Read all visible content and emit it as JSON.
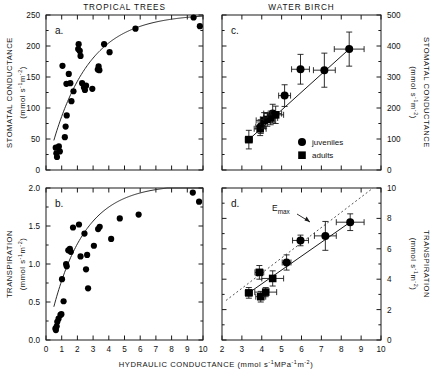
{
  "figure": {
    "width": 433,
    "height": 379,
    "panel_titles": {
      "left": "TROPICAL TREES",
      "right": "WATER BIRCH"
    },
    "xlabel": "HYDRAULIC CONDUCTANCE (mmol s⁻¹MPa⁻¹m⁻²)",
    "annotation_emax": "E",
    "annotation_emax_sub": "max",
    "legend": [
      {
        "marker": "circle",
        "label": "juveniles"
      },
      {
        "marker": "square",
        "label": "adults"
      }
    ]
  },
  "chart_data": [
    {
      "type": "scatter",
      "panel": "a.",
      "title": "TROPICAL TREES",
      "xlabel": "HYDRAULIC CONDUCTANCE (mmol s-1MPa-1m-2)",
      "ylabel": "STOMATAL CONDUCTANCE (mmol s-1m-2)",
      "xlim": [
        0,
        10
      ],
      "ylim": [
        0,
        250
      ],
      "xticks": [
        0,
        1,
        2,
        3,
        4,
        5,
        6,
        7,
        8,
        9,
        10
      ],
      "yticks": [
        0,
        50,
        100,
        150,
        200,
        250
      ],
      "grid": false,
      "points": [
        [
          0.62,
          36
        ],
        [
          0.66,
          27
        ],
        [
          0.7,
          21
        ],
        [
          0.82,
          38
        ],
        [
          0.88,
          30
        ],
        [
          1.05,
          168
        ],
        [
          1.3,
          139
        ],
        [
          1.32,
          88
        ],
        [
          1.25,
          70
        ],
        [
          1.2,
          53
        ],
        [
          1.45,
          155
        ],
        [
          1.55,
          140
        ],
        [
          1.62,
          111
        ],
        [
          1.75,
          127
        ],
        [
          2.05,
          195
        ],
        [
          2.08,
          203
        ],
        [
          2.2,
          184
        ],
        [
          2.15,
          192
        ],
        [
          2.3,
          140
        ],
        [
          2.42,
          133
        ],
        [
          2.48,
          129
        ],
        [
          2.55,
          136
        ],
        [
          2.95,
          131
        ],
        [
          3.3,
          162
        ],
        [
          3.35,
          167
        ],
        [
          3.4,
          161
        ],
        [
          3.7,
          203
        ],
        [
          4.05,
          190
        ],
        [
          5.7,
          228
        ],
        [
          9.4,
          246
        ],
        [
          9.8,
          232
        ]
      ],
      "fit_curve": {
        "form": "saturating",
        "ymax": 252,
        "k": 0.42
      },
      "legend_position": "none"
    },
    {
      "type": "scatter",
      "panel": "b.",
      "title": "TROPICAL TREES",
      "xlabel": "HYDRAULIC CONDUCTANCE (mmol s-1MPa-1m-2)",
      "ylabel": "TRANSPIRATION (mmol s-1m-2)",
      "xlim": [
        0,
        10
      ],
      "ylim": [
        0.0,
        2.0
      ],
      "xticks": [
        0,
        1,
        2,
        3,
        4,
        5,
        6,
        7,
        8,
        9,
        10
      ],
      "yticks": [
        0.0,
        0.5,
        1.0,
        1.5,
        2.0
      ],
      "grid": false,
      "points": [
        [
          0.6,
          0.15
        ],
        [
          0.63,
          0.13
        ],
        [
          0.68,
          0.18
        ],
        [
          0.72,
          0.24
        ],
        [
          0.8,
          0.28
        ],
        [
          0.92,
          0.33
        ],
        [
          0.98,
          0.34
        ],
        [
          1.02,
          0.8
        ],
        [
          1.12,
          0.51
        ],
        [
          1.28,
          1.0
        ],
        [
          1.32,
          0.97
        ],
        [
          1.42,
          1.18
        ],
        [
          1.52,
          1.2
        ],
        [
          1.58,
          1.16
        ],
        [
          1.72,
          1.48
        ],
        [
          2.1,
          1.52
        ],
        [
          2.2,
          1.1
        ],
        [
          2.45,
          1.4
        ],
        [
          2.55,
          0.93
        ],
        [
          2.62,
          1.12
        ],
        [
          2.68,
          0.68
        ],
        [
          3.05,
          1.24
        ],
        [
          3.32,
          1.46
        ],
        [
          3.42,
          1.49
        ],
        [
          4.15,
          1.33
        ],
        [
          4.7,
          1.6
        ],
        [
          5.9,
          1.65
        ],
        [
          9.35,
          1.94
        ],
        [
          9.75,
          1.82
        ]
      ],
      "fit_curve": {
        "form": "saturating",
        "ymax": 2.05,
        "k": 0.48
      },
      "legend_position": "none"
    },
    {
      "type": "scatter",
      "panel": "c.",
      "title": "WATER BIRCH",
      "xlabel": "HYDRAULIC CONDUCTANCE (mmol s-1MPa-1m-2)",
      "ylabel": "STOMATAL CONDUCTANCE (mmol s-1m-2)",
      "xlim": [
        2,
        10
      ],
      "ylim": [
        0,
        500
      ],
      "xticks": [
        2,
        3,
        4,
        5,
        6,
        7,
        8,
        9,
        10
      ],
      "yticks": [
        0,
        100,
        200,
        300,
        400,
        500
      ],
      "grid": false,
      "series": [
        {
          "name": "juveniles",
          "marker": "circle",
          "points": [
            {
              "x": 3.95,
              "y": 140,
              "xerr": 0.25,
              "yerr": 22
            },
            {
              "x": 4.55,
              "y": 182,
              "xerr": 0.45,
              "yerr": 30
            },
            {
              "x": 5.15,
              "y": 240,
              "xerr": 0.3,
              "yerr": 35
            },
            {
              "x": 5.95,
              "y": 325,
              "xerr": 0.45,
              "yerr": 48
            },
            {
              "x": 7.15,
              "y": 322,
              "xerr": 0.55,
              "yerr": 55
            },
            {
              "x": 8.4,
              "y": 390,
              "xerr": 0.75,
              "yerr": 55
            }
          ]
        },
        {
          "name": "adults",
          "marker": "square",
          "points": [
            {
              "x": 3.35,
              "y": 98,
              "xerr": 0.18,
              "yerr": 30
            },
            {
              "x": 3.92,
              "y": 133,
              "xerr": 0.3,
              "yerr": 22
            },
            {
              "x": 4.12,
              "y": 160,
              "xerr": 0.4,
              "yerr": 25
            },
            {
              "x": 4.28,
              "y": 163,
              "xerr": 0.35,
              "yerr": 22
            },
            {
              "x": 4.45,
              "y": 168,
              "xerr": 0.35,
              "yerr": 22
            },
            {
              "x": 4.7,
              "y": 178,
              "xerr": 0.4,
              "yerr": 28
            }
          ]
        }
      ],
      "fit_line": {
        "form": "linear",
        "x1": 3.35,
        "y1": 98,
        "x2": 8.4,
        "y2": 390
      },
      "legend_position": "lower-right"
    },
    {
      "type": "scatter",
      "panel": "d.",
      "title": "WATER BIRCH",
      "xlabel": "HYDRAULIC CONDUCTANCE (mmol s-1MPa-1m-2)",
      "ylabel": "TRANSPIRATION (mmol s-1m-2)",
      "xlim": [
        2,
        10
      ],
      "ylim": [
        0,
        10
      ],
      "xticks": [
        2,
        3,
        4,
        5,
        6,
        7,
        8,
        9,
        10
      ],
      "yticks": [
        0,
        2,
        4,
        6,
        8,
        10
      ],
      "grid": false,
      "annotations": [
        {
          "text": "Emax",
          "x": 4.4,
          "y": 8.7,
          "style": "dotted-line-label"
        }
      ],
      "reference_line": {
        "name": "Emax",
        "style": "dotted",
        "x1": 2.2,
        "y1": 2.6,
        "x2": 9.6,
        "y2": 10.6
      },
      "series": [
        {
          "name": "juveniles",
          "marker": "circle",
          "points": [
            {
              "x": 5.25,
              "y": 5.1,
              "xerr": 0.22,
              "yerr": 0.5
            },
            {
              "x": 5.95,
              "y": 6.55,
              "xerr": 0.4,
              "yerr": 0.35
            },
            {
              "x": 7.2,
              "y": 6.85,
              "xerr": 0.55,
              "yerr": 0.95
            },
            {
              "x": 8.45,
              "y": 7.75,
              "xerr": 0.7,
              "yerr": 0.55
            }
          ]
        },
        {
          "name": "adults",
          "marker": "square",
          "points": [
            {
              "x": 3.35,
              "y": 3.1,
              "xerr": 0.18,
              "yerr": 0.35
            },
            {
              "x": 3.88,
              "y": 4.45,
              "xerr": 0.22,
              "yerr": 0.45
            },
            {
              "x": 3.95,
              "y": 2.85,
              "xerr": 0.25,
              "yerr": 0.35
            },
            {
              "x": 4.2,
              "y": 3.15,
              "xerr": 0.55,
              "yerr": 0.3
            },
            {
              "x": 4.55,
              "y": 4.05,
              "xerr": 0.55,
              "yerr": 0.5
            }
          ]
        }
      ],
      "fit_line": {
        "form": "linear",
        "x1": 3.35,
        "y1": 3.1,
        "x2": 8.45,
        "y2": 7.75
      },
      "legend_position": "none"
    }
  ],
  "axes": {
    "left_top": {
      "ticks": [
        "250",
        "200",
        "150",
        "100",
        "50",
        "0"
      ],
      "label_main": "STOMATAL CONDUCTANCE",
      "label_units": "(mmol s⁻¹m⁻²)",
      "panel": "a."
    },
    "left_bottom": {
      "ticks": [
        "2.0",
        "1.5",
        "1.0",
        "0.5",
        "0.0"
      ],
      "label_main": "TRANSPIRATION",
      "label_units": "(mmol s⁻¹m⁻²)",
      "panel": "b."
    },
    "right_top": {
      "ticks": [
        "500",
        "400",
        "300",
        "200",
        "100",
        "0"
      ],
      "label_main": "STOMATAL CONDUCTANCE",
      "label_units": "(mmol s⁻¹m⁻²)",
      "panel": "c."
    },
    "right_bottom": {
      "ticks": [
        "10",
        "8",
        "6",
        "4",
        "2",
        "0"
      ],
      "label_main": "TRANSPIRATION",
      "label_units": "(mmol s⁻¹m⁻²)",
      "panel": "d."
    },
    "x_left": {
      "ticks": [
        "0",
        "1",
        "2",
        "3",
        "4",
        "5",
        "6",
        "7",
        "8",
        "9",
        "10"
      ]
    },
    "x_right": {
      "ticks": [
        "2",
        "3",
        "4",
        "5",
        "6",
        "7",
        "8",
        "9",
        "10"
      ]
    }
  }
}
